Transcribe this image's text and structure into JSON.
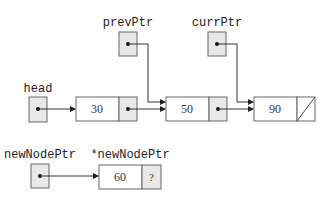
{
  "diagram": {
    "colors": {
      "pointer_fill": "#e8e8e8",
      "node_fill": "#ffffff",
      "stroke": "#666666",
      "arrow": "#333333"
    },
    "pointers": [
      {
        "id": "head",
        "label": "head",
        "points_to": "node-30"
      },
      {
        "id": "prevPtr",
        "label": "prevPtr",
        "points_to": "node-50"
      },
      {
        "id": "currPtr",
        "label": "currPtr",
        "points_to": "node-90"
      },
      {
        "id": "newNodePtr",
        "label": "newNodePtr",
        "points_to": "node-60"
      }
    ],
    "list_nodes": [
      {
        "id": "node-30",
        "value": "30",
        "next": "node-50"
      },
      {
        "id": "node-50",
        "value": "50",
        "next": "node-90"
      },
      {
        "id": "node-90",
        "value": "90",
        "next": "null"
      }
    ],
    "new_node": {
      "label": "*newNodePtr",
      "value": "60",
      "next": "?"
    }
  }
}
